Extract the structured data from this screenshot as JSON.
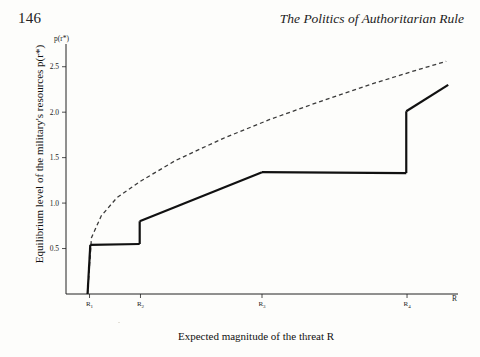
{
  "header": {
    "page_number": "146",
    "book_title": "The Politics of Authoritarian Rule"
  },
  "figure": {
    "y_axis_title": "Equilibrium level of the military's resources p(r*)",
    "x_axis_title": "Expected magnitude of the threat R",
    "y_axis_symbol": "p(r*)",
    "x_axis_symbol": "R"
  },
  "chart_data": {
    "type": "line",
    "title": "",
    "xlabel": "Expected magnitude of the threat R",
    "ylabel": "Equilibrium level of the military's resources p(r*)",
    "ytick_labels": [
      "0.5",
      "1.0",
      "1.5",
      "2.0",
      "2.5"
    ],
    "ytick_values": [
      0.5,
      1.0,
      1.5,
      2.0,
      2.5
    ],
    "ylim": [
      0.0,
      2.75
    ],
    "xtick_labels": [
      "R₁",
      "R₂",
      "R₃",
      "R₄"
    ],
    "xtick_bases": [
      "R",
      "R",
      "R",
      "R"
    ],
    "xtick_subscripts": [
      "1",
      "2",
      "3",
      "4"
    ],
    "xtick_values": [
      0.06,
      0.19,
      0.5,
      0.87
    ],
    "xlim": [
      0.0,
      1.0
    ],
    "grid": false,
    "legend": "none",
    "series": [
      {
        "name": "continuous benchmark",
        "style": "dashed",
        "color": "#3a3a3a",
        "points": [
          [
            0.055,
            0.0
          ],
          [
            0.065,
            0.62
          ],
          [
            0.09,
            0.86
          ],
          [
            0.13,
            1.06
          ],
          [
            0.19,
            1.24
          ],
          [
            0.28,
            1.47
          ],
          [
            0.4,
            1.71
          ],
          [
            0.52,
            1.92
          ],
          [
            0.65,
            2.12
          ],
          [
            0.78,
            2.31
          ],
          [
            0.9,
            2.47
          ],
          [
            0.97,
            2.56
          ]
        ]
      },
      {
        "name": "equilibrium step function",
        "style": "solid",
        "color": "#111111",
        "segments": [
          {
            "points": [
              [
                0.055,
                0.0
              ],
              [
                0.062,
                0.54
              ]
            ]
          },
          {
            "points": [
              [
                0.062,
                0.54
              ],
              [
                0.188,
                0.55
              ]
            ]
          },
          {
            "points": [
              [
                0.188,
                0.55
              ],
              [
                0.188,
                0.8
              ]
            ],
            "jump": true
          },
          {
            "points": [
              [
                0.188,
                0.8
              ],
              [
                0.5,
                1.34
              ]
            ]
          },
          {
            "points": [
              [
                0.5,
                1.34
              ],
              [
                0.868,
                1.33
              ]
            ]
          },
          {
            "points": [
              [
                0.868,
                1.33
              ],
              [
                0.868,
                2.01
              ]
            ],
            "jump": true
          },
          {
            "points": [
              [
                0.868,
                2.01
              ],
              [
                0.975,
                2.3
              ]
            ]
          }
        ]
      }
    ]
  }
}
